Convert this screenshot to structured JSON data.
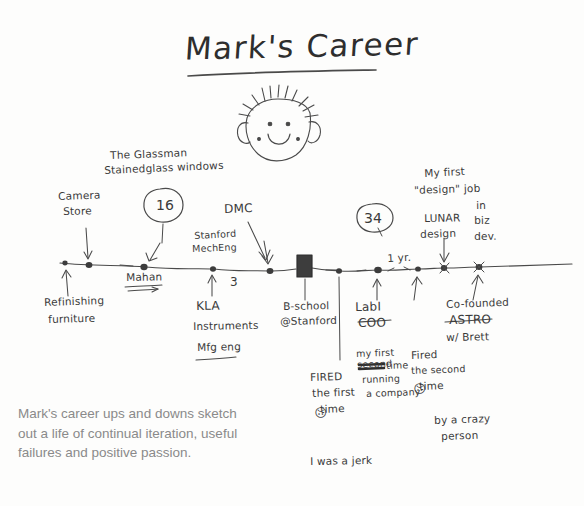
{
  "sketch": {
    "title": "Mark's Career",
    "face": {
      "name": "mark-face-doodle"
    },
    "timeline_nodes": [
      {
        "id": "start",
        "x": 65,
        "y": 264
      },
      {
        "id": "camera-store",
        "x": 89,
        "y": 265
      },
      {
        "id": "glassman",
        "x": 144,
        "y": 267
      },
      {
        "id": "stanford",
        "x": 213,
        "y": 269
      },
      {
        "id": "dmc",
        "x": 270,
        "y": 271
      },
      {
        "id": "bschool-block",
        "x": 302,
        "y": 258
      },
      {
        "id": "post-bschool",
        "x": 339,
        "y": 271
      },
      {
        "id": "labi-coo",
        "x": 378,
        "y": 270
      },
      {
        "id": "oneyear",
        "x": 418,
        "y": 269
      },
      {
        "id": "lunar",
        "x": 444,
        "y": 268
      },
      {
        "id": "astro",
        "x": 479,
        "y": 267
      }
    ],
    "labels": {
      "glassman_line1": "The Glassman",
      "glassman_line2": "Stainedglass windows",
      "circle_16": "16",
      "camera_store_line1": "Camera",
      "camera_store_line2": "Store",
      "refinishing_line1": "Refinishing",
      "refinishing_line2": "furniture",
      "mahan": "Mahan",
      "stanford_line1": "Stanford",
      "stanford_line2": "MechEng",
      "three": "3",
      "kla_line1": "KLA",
      "kla_line2": "Instruments",
      "kla_line3": "Mfg eng",
      "dmc": "DMC",
      "bschool_line1": "B-school",
      "bschool_line2": "@Stanford",
      "circle_34": "34",
      "one_year": "1 yr.",
      "labi_line1": "LabI",
      "labi_line2": "COO",
      "first_time_line1": "my first",
      "first_time_line2": "time",
      "first_time_strike": "second",
      "first_time_line3": "running",
      "first_time_line4": "a company",
      "fired_first_line1": "FIRED",
      "fired_first_line2": "the first",
      "fired_first_line3": "time",
      "fired_first_face": "☹",
      "jerk": "I was a jerk",
      "fired_second_line1": "Fired",
      "fired_second_line2": "the second",
      "fired_second_line3": "time",
      "fired_second_face": "☹",
      "fired_second_line4": "by a crazy",
      "fired_second_line5": "person",
      "lunar_line1": "My first",
      "lunar_line2": "\"design\" job",
      "lunar_line3": "LUNAR",
      "lunar_line4": "design",
      "lunar_line5": "in",
      "lunar_line6": "biz",
      "lunar_line7": "dev.",
      "astro_line1": "Co-founded",
      "astro_line2": "ASTRO",
      "astro_line3": "w/ Brett"
    }
  },
  "caption": {
    "text": "Mark's career ups and downs sketch out a life of continual iteration, useful failures and positive passion."
  },
  "colors": {
    "ink": "#3a3a3a",
    "caption": "#8a8a8a",
    "background": "#fdfdfc"
  }
}
